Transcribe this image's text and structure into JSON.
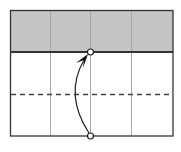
{
  "diagram": {
    "type": "origami-fold-step",
    "colors": {
      "paper_back": "#c4c4c4",
      "paper_front": "#ffffff",
      "outline": "#333333",
      "crease": "#a8a8a8",
      "valley_fold": "#444444",
      "arrow": "#222222"
    },
    "frame": {
      "left": 10,
      "top": 10,
      "right": 173,
      "bottom": 136
    },
    "flap_edge_y": 52,
    "creases_x": [
      50,
      90,
      131
    ],
    "valley_fold_y": 94,
    "markers": [
      {
        "name": "target-point",
        "x": 90,
        "y": 52
      },
      {
        "name": "source-point",
        "x": 90,
        "y": 136
      }
    ],
    "arrow": {
      "from": [
        90,
        133
      ],
      "to": [
        86,
        57
      ],
      "control": [
        65,
        95
      ]
    }
  }
}
